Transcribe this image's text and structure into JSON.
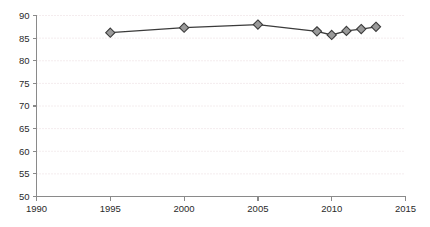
{
  "chart_data": {
    "type": "line",
    "title": "",
    "subtitle": "",
    "xlabel": "",
    "ylabel": "",
    "x": [
      1995,
      2000,
      2005,
      2009,
      2010,
      2011,
      2012,
      2013
    ],
    "values": [
      86.2,
      87.3,
      88.0,
      86.5,
      85.7,
      86.6,
      87.0,
      87.5
    ],
    "series": [
      {
        "name": "",
        "x": [
          1995,
          2000,
          2005,
          2009,
          2010,
          2011,
          2012,
          2013
        ],
        "values": [
          86.2,
          87.3,
          88.0,
          86.5,
          85.7,
          86.6,
          87.0,
          87.5
        ]
      }
    ],
    "xlim": [
      1990,
      2015
    ],
    "ylim": [
      50,
      90
    ],
    "xticks": [
      1990,
      1995,
      2000,
      2005,
      2010,
      2015
    ],
    "yticks": [
      50,
      55,
      60,
      65,
      70,
      75,
      80,
      85,
      90
    ],
    "xtick_labels": [
      "1990",
      "1995",
      "2000",
      "2005",
      "2010",
      "2015"
    ],
    "ytick_labels": [
      "50",
      "55",
      "60",
      "65",
      "70",
      "75",
      "80",
      "85",
      "90"
    ],
    "grid": "horizontal-dotted",
    "legend": "none",
    "marker": "diamond",
    "colors": {
      "line": "#3b3b3b",
      "marker_fill": "#9a9a9a",
      "marker_edge": "#3b3b3b",
      "gridline": "#e8d9dc",
      "axis": "#8a8a8a",
      "tick_label": "#2a2a2a",
      "background": "#ffffff"
    }
  }
}
